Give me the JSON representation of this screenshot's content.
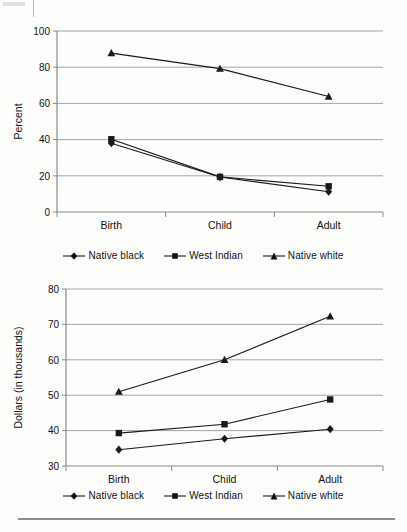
{
  "figure": {
    "series_names": [
      "Native black",
      "West Indian",
      "Native white"
    ],
    "series_markers": [
      "diamond-marker-icon",
      "square-marker-icon",
      "triangle-marker-icon"
    ],
    "categories": [
      "Birth",
      "Child",
      "Adult"
    ]
  },
  "chart_data": [
    {
      "type": "line",
      "title": "",
      "xlabel": "",
      "ylabel": "Percent",
      "categories": [
        "Birth",
        "Child",
        "Adult"
      ],
      "ylim": [
        0,
        100
      ],
      "yticks": [
        0,
        20,
        40,
        60,
        80,
        100
      ],
      "ytick_labels": [
        "0",
        "20",
        "40",
        "60",
        "80",
        "100"
      ],
      "grid": "horizontal",
      "legend_position": "bottom",
      "series": [
        {
          "name": "Native black",
          "marker": "diamond",
          "values": [
            38.0,
            19.3,
            11.2
          ]
        },
        {
          "name": "West Indian",
          "marker": "square",
          "values": [
            40.2,
            19.4,
            14.2
          ]
        },
        {
          "name": "Native white",
          "marker": "triangle",
          "values": [
            87.8,
            79.2,
            63.8
          ]
        }
      ]
    },
    {
      "type": "line",
      "title": "",
      "xlabel": "",
      "ylabel": "Dollars (in thousands)",
      "categories": [
        "Birth",
        "Child",
        "Adult"
      ],
      "ylim": [
        30,
        80
      ],
      "yticks": [
        30,
        40,
        50,
        60,
        70,
        80
      ],
      "ytick_labels": [
        "30",
        "40",
        "50",
        "60",
        "70",
        "80"
      ],
      "grid": "horizontal",
      "legend_position": "bottom",
      "series": [
        {
          "name": "Native black",
          "marker": "diamond",
          "values": [
            34.6,
            37.7,
            40.4
          ]
        },
        {
          "name": "West Indian",
          "marker": "square",
          "values": [
            39.3,
            41.8,
            48.8
          ]
        },
        {
          "name": "Native white",
          "marker": "triangle",
          "values": [
            51.0,
            60.0,
            72.3
          ]
        }
      ]
    }
  ],
  "chart1": {
    "ylabel": "Percent",
    "ytick_0": "0",
    "ytick_1": "20",
    "ytick_2": "40",
    "ytick_3": "60",
    "ytick_4": "80",
    "ytick_5": "100",
    "xtick_0": "Birth",
    "xtick_1": "Child",
    "xtick_2": "Adult",
    "legend_0": "Native black",
    "legend_1": "West Indian",
    "legend_2": "Native white"
  },
  "chart2": {
    "ylabel": "Dollars (in thousands)",
    "ytick_0": "30",
    "ytick_1": "40",
    "ytick_2": "50",
    "ytick_3": "60",
    "ytick_4": "70",
    "ytick_5": "80",
    "xtick_0": "Birth",
    "xtick_1": "Child",
    "xtick_2": "Adult",
    "legend_0": "Native black",
    "legend_1": "West Indian",
    "legend_2": "Native white"
  },
  "colors": {
    "line": "#1a1a1a",
    "grid": "#9a9a9a",
    "axis": "#8a8a8a",
    "text": "#111111",
    "background": "#fdfdfc"
  }
}
